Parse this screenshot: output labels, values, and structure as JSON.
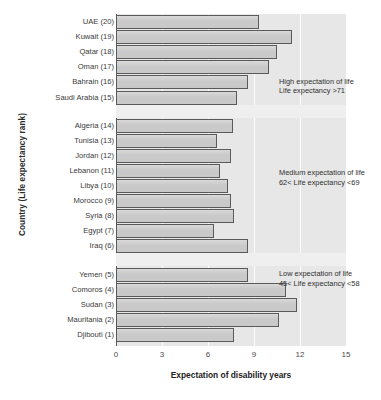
{
  "chart_data": {
    "type": "bar",
    "orientation": "horizontal",
    "title": "",
    "xlabel": "Expectation of disability years",
    "ylabel": "Country (Life expectancy rank)",
    "xlim": [
      0,
      15
    ],
    "xticks": [
      0,
      3,
      6,
      9,
      12,
      15
    ],
    "xtick_labels": [
      "0",
      "3",
      "6",
      "9",
      "12",
      "15"
    ],
    "grid": "vertical-white-gridlines",
    "legend": "none",
    "bar_fill_color": "#c9c9c9",
    "bar_edge_color": "#5a5a5a",
    "plot_background_color": "#e7e7e7",
    "categories": [
      "UAE (20)",
      "Kuwait (19)",
      "Qatar (18)",
      "Oman (17)",
      "Bahrain (16)",
      "Saudi Arabia (15)",
      "Algeria (14)",
      "Tunisia (13)",
      "Jordan (12)",
      "Lebanon (11)",
      "Libya (10)",
      "Morocco (9)",
      "Syria (8)",
      "Egypt (7)",
      "Iraq (6)",
      "Yemen (5)",
      "Comoros (4)",
      "Sudan (3)",
      "Mauritania (2)",
      "Djibouti (1)"
    ],
    "values": [
      9.3,
      11.5,
      10.5,
      10.0,
      8.6,
      7.9,
      7.6,
      6.6,
      7.5,
      6.8,
      7.3,
      7.5,
      7.7,
      6.4,
      8.6,
      8.6,
      11.1,
      11.8,
      10.6,
      7.7
    ],
    "groups": [
      {
        "name": "high",
        "note_line1": "High expectation of life",
        "note_line2": "Life expectancy >71",
        "members": [
          "UAE (20)",
          "Kuwait (19)",
          "Qatar (18)",
          "Oman (17)",
          "Bahrain (16)",
          "Saudi Arabia (15)"
        ]
      },
      {
        "name": "medium",
        "note_line1": "Medium expectation of life",
        "note_line2": "62< Life expectancy <69",
        "members": [
          "Algeria (14)",
          "Tunisia (13)",
          "Jordan (12)",
          "Lebanon (11)",
          "Libya (10)",
          "Morocco (9)",
          "Syria (8)",
          "Egypt (7)",
          "Iraq (6)"
        ]
      },
      {
        "name": "low",
        "note_line1": "Low expectation of life",
        "note_line2": "45< Life expectancy <58",
        "members": [
          "Yemen (5)",
          "Comoros (4)",
          "Sudan (3)",
          "Mauritania (2)",
          "Djibouti (1)"
        ]
      }
    ]
  }
}
